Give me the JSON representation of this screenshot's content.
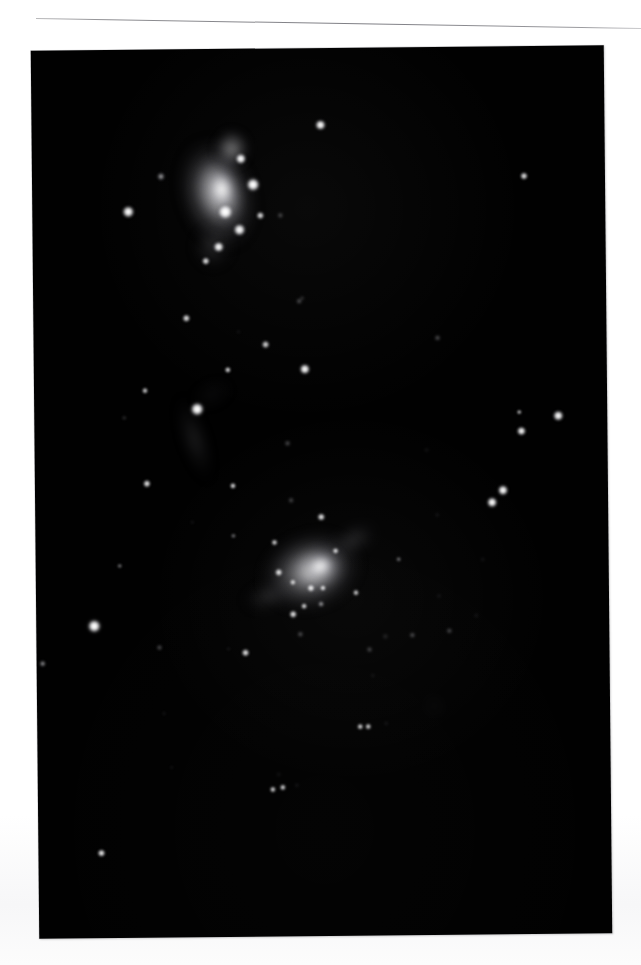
{
  "page": {
    "background_color": "#ffffff",
    "caption": ""
  },
  "rule": {
    "name": "horizontal-rule",
    "color": "#8e8e92",
    "tilt_degrees": 0.95
  },
  "plate": {
    "title": "",
    "background_color": "#010101",
    "left": 35,
    "top": 48,
    "width": 573,
    "height": 888,
    "tilt_degrees": -0.55
  },
  "chart_data": {
    "type": "scatter",
    "title": "",
    "subtitle": "",
    "xlabel": "",
    "ylabel": "",
    "grid": false,
    "legend": "none",
    "xlim": [
      0,
      573
    ],
    "ylim": [
      0,
      888
    ],
    "note": "Monochrome astronomical plate: two luminous irregular galaxies with embedded knots, plus a field of stars. Coordinates are pixel positions inside the plate; 'b' is relative surface brightness 0-1.",
    "nebulae": [
      {
        "name": "upper-galaxy-envelope",
        "x": 185,
        "y": 145,
        "rx": 46,
        "ry": 66,
        "b": 0.72,
        "rot": -16
      },
      {
        "name": "upper-galaxy-inner",
        "x": 188,
        "y": 142,
        "rx": 30,
        "ry": 44,
        "b": 0.9,
        "rot": -14
      },
      {
        "name": "upper-galaxy-core-glow",
        "x": 190,
        "y": 140,
        "rx": 18,
        "ry": 24,
        "b": 1.0,
        "rot": -10
      },
      {
        "name": "upper-galaxy-north-lobe",
        "x": 200,
        "y": 100,
        "rx": 22,
        "ry": 24,
        "b": 0.55,
        "rot": 0
      },
      {
        "name": "upper-galaxy-south-tail",
        "x": 180,
        "y": 198,
        "rx": 24,
        "ry": 26,
        "b": 0.4,
        "rot": 0
      },
      {
        "name": "mid-galaxy-streak",
        "x": 160,
        "y": 390,
        "rx": 16,
        "ry": 52,
        "b": 0.26,
        "rot": -17
      },
      {
        "name": "mid-galaxy-plume",
        "x": 178,
        "y": 345,
        "rx": 26,
        "ry": 17,
        "b": 0.22,
        "rot": -22
      },
      {
        "name": "lower-galaxy-envelope",
        "x": 275,
        "y": 523,
        "rx": 60,
        "ry": 47,
        "b": 0.78,
        "rot": -18
      },
      {
        "name": "lower-galaxy-inner",
        "x": 281,
        "y": 521,
        "rx": 36,
        "ry": 28,
        "b": 0.92,
        "rot": -18
      },
      {
        "name": "lower-galaxy-core-glow",
        "x": 285,
        "y": 518,
        "rx": 19,
        "ry": 16,
        "b": 1.0,
        "rot": -18
      },
      {
        "name": "lower-galaxy-ne-arm",
        "x": 318,
        "y": 492,
        "rx": 30,
        "ry": 18,
        "b": 0.42,
        "rot": -28
      },
      {
        "name": "lower-galaxy-sw-arm",
        "x": 232,
        "y": 548,
        "rx": 30,
        "ry": 17,
        "b": 0.38,
        "rot": -14
      },
      {
        "name": "faint-elliptical-galaxy",
        "x": 397,
        "y": 659,
        "rx": 11,
        "ry": 14,
        "b": 0.2,
        "rot": -30
      }
    ],
    "stars": [
      {
        "x": 289,
        "y": 77,
        "r": 7.2,
        "b": 0.96
      },
      {
        "x": 129,
        "y": 127,
        "r": 4.6,
        "b": 0.7
      },
      {
        "x": 96,
        "y": 162,
        "r": 8.4,
        "b": 0.97
      },
      {
        "x": 209,
        "y": 110,
        "r": 6.8,
        "b": 0.98
      },
      {
        "x": 221,
        "y": 136,
        "r": 8.6,
        "b": 1.0
      },
      {
        "x": 193,
        "y": 163,
        "r": 9.6,
        "b": 1.0
      },
      {
        "x": 228,
        "y": 167,
        "r": 4.6,
        "b": 0.82
      },
      {
        "x": 248,
        "y": 167,
        "r": 3.0,
        "b": 0.5
      },
      {
        "x": 207,
        "y": 181,
        "r": 7.6,
        "b": 0.96
      },
      {
        "x": 186,
        "y": 198,
        "r": 7.0,
        "b": 0.95
      },
      {
        "x": 173,
        "y": 212,
        "r": 4.6,
        "b": 0.84
      },
      {
        "x": 492,
        "y": 130,
        "r": 5.0,
        "b": 0.8
      },
      {
        "x": 153,
        "y": 269,
        "r": 5.2,
        "b": 0.86
      },
      {
        "x": 232,
        "y": 296,
        "r": 4.6,
        "b": 0.78
      },
      {
        "x": 194,
        "y": 321,
        "r": 4.2,
        "b": 0.82
      },
      {
        "x": 266,
        "y": 253,
        "r": 3.2,
        "b": 0.58
      },
      {
        "x": 271,
        "y": 321,
        "r": 7.2,
        "b": 0.96
      },
      {
        "x": 111,
        "y": 341,
        "r": 3.8,
        "b": 0.72
      },
      {
        "x": 90,
        "y": 368,
        "r": 2.4,
        "b": 0.46
      },
      {
        "x": 269,
        "y": 250,
        "r": 2.4,
        "b": 0.46
      },
      {
        "x": 163,
        "y": 360,
        "r": 9.0,
        "b": 1.0
      },
      {
        "x": 112,
        "y": 434,
        "r": 5.0,
        "b": 0.86
      },
      {
        "x": 198,
        "y": 437,
        "r": 4.4,
        "b": 0.82
      },
      {
        "x": 253,
        "y": 395,
        "r": 3.2,
        "b": 0.56
      },
      {
        "x": 404,
        "y": 291,
        "r": 3.4,
        "b": 0.6
      },
      {
        "x": 256,
        "y": 452,
        "r": 2.6,
        "b": 0.46
      },
      {
        "x": 198,
        "y": 487,
        "r": 3.4,
        "b": 0.62
      },
      {
        "x": 157,
        "y": 473,
        "r": 2.2,
        "b": 0.4
      },
      {
        "x": 485,
        "y": 366,
        "r": 3.2,
        "b": 0.72
      },
      {
        "x": 524,
        "y": 370,
        "r": 6.6,
        "b": 0.96
      },
      {
        "x": 487,
        "y": 385,
        "r": 6.0,
        "b": 0.94
      },
      {
        "x": 457,
        "y": 456,
        "r": 7.4,
        "b": 0.98
      },
      {
        "x": 468,
        "y": 444,
        "r": 6.8,
        "b": 0.96
      },
      {
        "x": 286,
        "y": 469,
        "r": 5.2,
        "b": 0.84
      },
      {
        "x": 84,
        "y": 516,
        "r": 3.4,
        "b": 0.62
      },
      {
        "x": 239,
        "y": 494,
        "r": 4.2,
        "b": 0.82
      },
      {
        "x": 243,
        "y": 524,
        "r": 4.6,
        "b": 0.88
      },
      {
        "x": 257,
        "y": 534,
        "r": 4.0,
        "b": 0.8
      },
      {
        "x": 287,
        "y": 540,
        "r": 4.2,
        "b": 0.84
      },
      {
        "x": 300,
        "y": 503,
        "r": 4.4,
        "b": 0.86
      },
      {
        "x": 268,
        "y": 558,
        "r": 4.2,
        "b": 0.8
      },
      {
        "x": 285,
        "y": 556,
        "r": 3.6,
        "b": 0.7
      },
      {
        "x": 320,
        "y": 545,
        "r": 3.8,
        "b": 0.72
      },
      {
        "x": 363,
        "y": 512,
        "r": 3.2,
        "b": 0.66
      },
      {
        "x": 58,
        "y": 576,
        "r": 9.0,
        "b": 1.0
      },
      {
        "x": 6,
        "y": 613,
        "r": 3.6,
        "b": 0.7
      },
      {
        "x": 123,
        "y": 598,
        "r": 3.0,
        "b": 0.58
      },
      {
        "x": 209,
        "y": 604,
        "r": 4.6,
        "b": 0.86
      },
      {
        "x": 192,
        "y": 600,
        "r": 2.4,
        "b": 0.42
      },
      {
        "x": 257,
        "y": 566,
        "r": 4.6,
        "b": 0.86
      },
      {
        "x": 264,
        "y": 586,
        "r": 3.0,
        "b": 0.58
      },
      {
        "x": 376,
        "y": 588,
        "r": 3.2,
        "b": 0.56
      },
      {
        "x": 413,
        "y": 584,
        "r": 2.8,
        "b": 0.5
      },
      {
        "x": 440,
        "y": 569,
        "r": 2.4,
        "b": 0.44
      },
      {
        "x": 403,
        "y": 549,
        "r": 2.2,
        "b": 0.4
      },
      {
        "x": 333,
        "y": 602,
        "r": 2.8,
        "b": 0.5
      },
      {
        "x": 349,
        "y": 589,
        "r": 2.6,
        "b": 0.44
      },
      {
        "x": 323,
        "y": 679,
        "r": 4.4,
        "b": 0.8
      },
      {
        "x": 331,
        "y": 679,
        "r": 4.2,
        "b": 0.78
      },
      {
        "x": 349,
        "y": 676,
        "r": 2.4,
        "b": 0.44
      },
      {
        "x": 275,
        "y": 540,
        "r": 4.6,
        "b": 0.88
      },
      {
        "x": 127,
        "y": 664,
        "r": 2.2,
        "b": 0.38
      },
      {
        "x": 235,
        "y": 741,
        "r": 4.0,
        "b": 0.78
      },
      {
        "x": 245,
        "y": 739,
        "r": 4.2,
        "b": 0.8
      },
      {
        "x": 259,
        "y": 737,
        "r": 2.2,
        "b": 0.4
      },
      {
        "x": 241,
        "y": 726,
        "r": 1.8,
        "b": 0.3
      },
      {
        "x": 63,
        "y": 803,
        "r": 5.4,
        "b": 0.9
      },
      {
        "x": 134,
        "y": 718,
        "r": 1.8,
        "b": 0.28
      },
      {
        "x": 402,
        "y": 468,
        "r": 2.4,
        "b": 0.42
      },
      {
        "x": 447,
        "y": 513,
        "r": 2.2,
        "b": 0.36
      },
      {
        "x": 336,
        "y": 628,
        "r": 1.8,
        "b": 0.28
      },
      {
        "x": 392,
        "y": 403,
        "r": 2.0,
        "b": 0.3
      },
      {
        "x": 205,
        "y": 283,
        "r": 2.0,
        "b": 0.32
      }
    ]
  }
}
